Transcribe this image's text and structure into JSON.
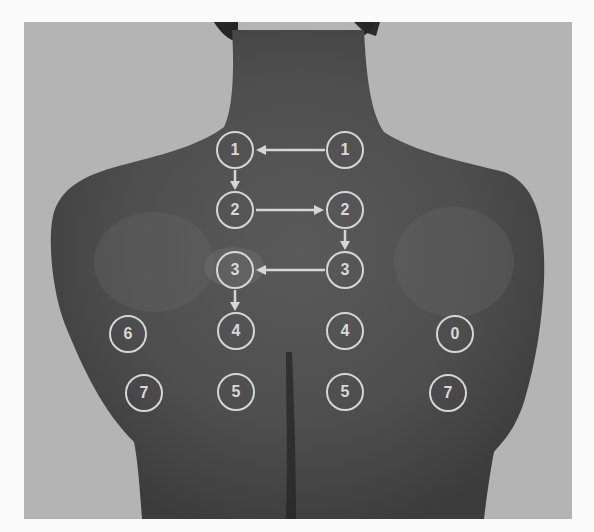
{
  "image": {
    "description": "Back view of a person's upper back with numbered circular markers and directional arrows",
    "background_color": "#b4b4b4",
    "skin_tone": "#4a4a4a",
    "marker_color": "#d6d6d6"
  },
  "markers": [
    {
      "id": "m1-left",
      "label": "1",
      "x": 235,
      "y": 150
    },
    {
      "id": "m1-right",
      "label": "1",
      "x": 345,
      "y": 150
    },
    {
      "id": "m2-left",
      "label": "2",
      "x": 235,
      "y": 210
    },
    {
      "id": "m2-right",
      "label": "2",
      "x": 345,
      "y": 210
    },
    {
      "id": "m3-left",
      "label": "3",
      "x": 235,
      "y": 270
    },
    {
      "id": "m3-right",
      "label": "3",
      "x": 345,
      "y": 270
    },
    {
      "id": "m4-left",
      "label": "4",
      "x": 236,
      "y": 331
    },
    {
      "id": "m4-right",
      "label": "4",
      "x": 345,
      "y": 331
    },
    {
      "id": "m5-left",
      "label": "5",
      "x": 236,
      "y": 392
    },
    {
      "id": "m5-right",
      "label": "5",
      "x": 345,
      "y": 392
    },
    {
      "id": "m6-left",
      "label": "6",
      "x": 128,
      "y": 334
    },
    {
      "id": "m6-right",
      "label": "0",
      "x": 455,
      "y": 334
    },
    {
      "id": "m7-left",
      "label": "7",
      "x": 144,
      "y": 393
    },
    {
      "id": "m7-right",
      "label": "7",
      "x": 448,
      "y": 393
    }
  ],
  "arrows": [
    {
      "from": "m1-right",
      "to": "m1-left",
      "direction": "left"
    },
    {
      "from": "m1-left",
      "to": "m2-left",
      "direction": "down"
    },
    {
      "from": "m2-left",
      "to": "m2-right",
      "direction": "right"
    },
    {
      "from": "m2-right",
      "to": "m3-right",
      "direction": "down"
    },
    {
      "from": "m3-right",
      "to": "m3-left",
      "direction": "left"
    },
    {
      "from": "m3-left",
      "to": "m4-left",
      "direction": "down"
    }
  ]
}
